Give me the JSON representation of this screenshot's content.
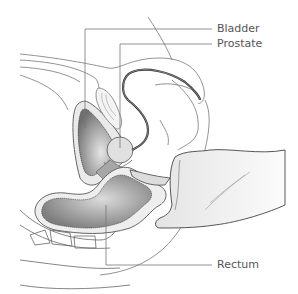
{
  "diagram": {
    "type": "anatomical-cross-section",
    "labels": [
      {
        "id": "bladder",
        "text": "Bladder"
      },
      {
        "id": "prostate",
        "text": "Prostate"
      },
      {
        "id": "rectum",
        "text": "Rectum"
      }
    ],
    "colors": {
      "outline": "#555555",
      "leader_line": "#777777",
      "organ_fill_dark": "#8a8a8a",
      "organ_fill_light": "#d8d8d8",
      "hand_fill": "#efefef",
      "urethra": "#333333"
    }
  }
}
